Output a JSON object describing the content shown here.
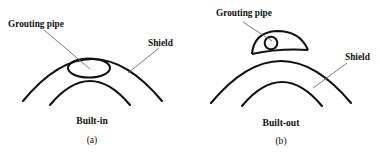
{
  "figure": {
    "domain": "diagram",
    "background_color": "#ffffff",
    "line_color": "#111111",
    "leader_color": "#6d6d6d",
    "width": 380,
    "height": 152
  },
  "panels": [
    {
      "id": "a",
      "caption": "Built-in",
      "subcaption": "(a)",
      "labels": {
        "pipe": "Grouting pipe",
        "shield": "Shield"
      },
      "geometry": {
        "shield_arc": "M 23 101 Q 92 17 162 101",
        "lining_arc": "M 50 105 Q 90 57 130 105",
        "pipe_shape": "ellipse",
        "pipe_cx": 89,
        "pipe_cy": 68,
        "pipe_rx": 21,
        "pipe_ry": 9.5,
        "pipe_leader": "M 44 30 L 90 69",
        "shield_leader": "M 159 48 L 128 73"
      },
      "text_positions": {
        "pipe_label_x": 8,
        "pipe_label_y": 27,
        "shield_label_x": 148,
        "shield_label_y": 46,
        "caption_x": 92,
        "caption_y": 124,
        "subcaption_x": 92,
        "subcaption_y": 143
      }
    },
    {
      "id": "b",
      "caption": "Built-out",
      "subcaption": "(b)",
      "labels": {
        "pipe": "Grouting pipe",
        "shield": "Shield"
      },
      "geometry": {
        "shield_arc": "M 211 103 Q 281 19 351 103",
        "lining_arc": "M 242 106 Q 282 58 322 106",
        "pipe_shape": "circle",
        "pipe_cx": 271,
        "pipe_cy": 43,
        "pipe_r": 6.3,
        "dome_outline": "M 252 54 Q 254 32 277 31 Q 300 31 308 50",
        "dome_base": "M 252 54 Q 280 48 308 50",
        "pipe_leader": "M 243 22 L 272 41",
        "shield_leader": "M 347 63 L 313 88"
      },
      "text_positions": {
        "pipe_label_x": 216,
        "pipe_label_y": 16,
        "shield_label_x": 345,
        "shield_label_y": 60,
        "caption_x": 281,
        "caption_y": 126,
        "subcaption_x": 281,
        "subcaption_y": 144
      }
    }
  ]
}
